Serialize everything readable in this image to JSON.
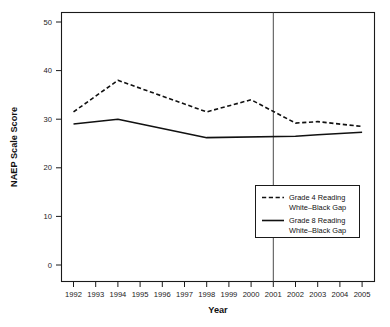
{
  "chart_data": {
    "type": "line",
    "title": "",
    "xlabel": "Year",
    "ylabel": "NAEP Scale Score",
    "x": [
      1992,
      1993,
      1994,
      1995,
      1996,
      1997,
      1998,
      1999,
      2000,
      2001,
      2002,
      2003,
      2004,
      2005
    ],
    "categories": [
      "1992",
      "1993",
      "1994",
      "1995",
      "1996",
      "1997",
      "1998",
      "1999",
      "2000",
      "2001",
      "2002",
      "2003",
      "2004",
      "2005"
    ],
    "xlim": [
      1991.5,
      2005.5
    ],
    "ylim": [
      -2,
      52.5
    ],
    "yticks": [
      0,
      10,
      20,
      30,
      40,
      50
    ],
    "ytick_labels": [
      "0",
      "10",
      "20",
      "30",
      "40",
      "50"
    ],
    "grid": false,
    "legend_position": "lower right",
    "series": [
      {
        "name": "Grade 4 Reading White–Black Gap",
        "style": "dashed",
        "color": "#111111",
        "x": [
          1992,
          1994,
          1998,
          2000,
          2002,
          2003,
          2005
        ],
        "values": [
          31.5,
          38.0,
          31.5,
          34.0,
          29.2,
          29.5,
          28.5
        ]
      },
      {
        "name": "Grade 8 Reading White–Black Gap",
        "style": "solid",
        "color": "#111111",
        "x": [
          1992,
          1994,
          1998,
          2002,
          2003,
          2005
        ],
        "values": [
          29.0,
          30.0,
          26.2,
          26.5,
          26.8,
          27.3
        ]
      }
    ],
    "annotations": [
      {
        "type": "vertical-reference-line",
        "x": 2001,
        "color": "#4a4a4a",
        "label": ""
      }
    ],
    "legend": [
      {
        "line1": "Grade 4 Reading",
        "line2": "White–Black Gap",
        "style": "dashed"
      },
      {
        "line1": "Grade 8 Reading",
        "line2": "White–Black Gap",
        "style": "solid"
      }
    ]
  }
}
